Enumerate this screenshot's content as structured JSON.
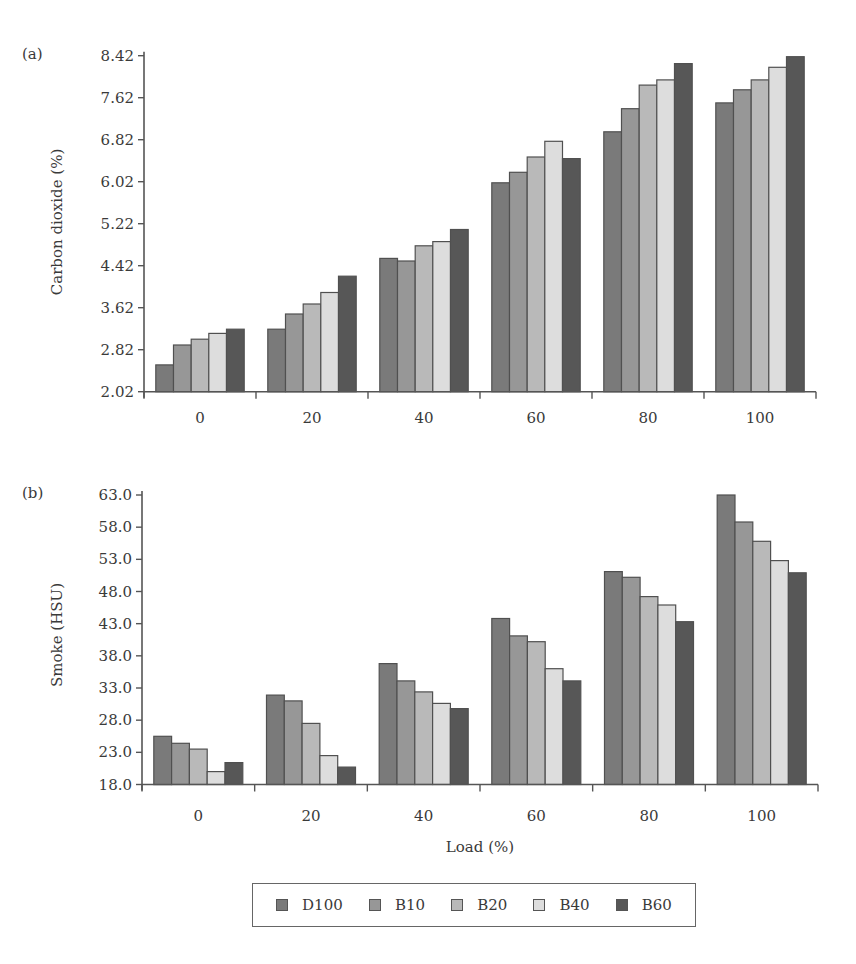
{
  "figure": {
    "legend": {
      "items": [
        {
          "label": "D100",
          "color": "#7a7a7a"
        },
        {
          "label": "B10",
          "color": "#979797"
        },
        {
          "label": "B20",
          "color": "#b9b9b9"
        },
        {
          "label": "B40",
          "color": "#dddddd"
        },
        {
          "label": "B60",
          "color": "#575757"
        }
      ]
    }
  },
  "chart_data": [
    {
      "type": "bar",
      "panel": "(a)",
      "title": "",
      "xlabel": "Load (%)",
      "ylabel": "Carbon dioxide (%)",
      "categories": [
        "0",
        "20",
        "40",
        "60",
        "80",
        "100"
      ],
      "yticks": [
        "2.02",
        "2.82",
        "3.62",
        "4.42",
        "5.22",
        "6.02",
        "6.82",
        "7.62",
        "8.42"
      ],
      "ylim": [
        2.02,
        8.42
      ],
      "grid": false,
      "legend_position": "bottom",
      "series": [
        {
          "name": "D100",
          "values": [
            2.53,
            3.21,
            4.56,
            6.0,
            6.97,
            7.52
          ]
        },
        {
          "name": "B10",
          "values": [
            2.91,
            3.5,
            4.51,
            6.2,
            7.41,
            7.77
          ]
        },
        {
          "name": "B20",
          "values": [
            3.02,
            3.69,
            4.8,
            6.49,
            7.86,
            7.96
          ]
        },
        {
          "name": "B40",
          "values": [
            3.13,
            3.91,
            4.88,
            6.79,
            7.96,
            8.2
          ]
        },
        {
          "name": "B60",
          "values": [
            3.21,
            4.22,
            5.11,
            6.46,
            8.27,
            8.4
          ]
        }
      ]
    },
    {
      "type": "bar",
      "panel": "(b)",
      "title": "",
      "xlabel": "Load (%)",
      "ylabel": "Smoke (HSU)",
      "categories": [
        "0",
        "20",
        "40",
        "60",
        "80",
        "100"
      ],
      "yticks": [
        "18.0",
        "23.0",
        "28.0",
        "33.0",
        "38.0",
        "43.0",
        "48.0",
        "53.0",
        "58.0",
        "63.0"
      ],
      "ylim": [
        18.0,
        63.0
      ],
      "grid": false,
      "legend_position": "bottom",
      "series": [
        {
          "name": "D100",
          "values": [
            25.5,
            31.9,
            36.8,
            43.8,
            51.1,
            63.0
          ]
        },
        {
          "name": "B10",
          "values": [
            24.4,
            31.0,
            34.1,
            41.1,
            50.2,
            58.8
          ]
        },
        {
          "name": "B20",
          "values": [
            23.5,
            27.5,
            32.4,
            40.2,
            47.2,
            55.8
          ]
        },
        {
          "name": "B40",
          "values": [
            20.0,
            22.5,
            30.6,
            36.0,
            45.9,
            52.8
          ]
        },
        {
          "name": "B60",
          "values": [
            21.4,
            20.7,
            29.8,
            34.1,
            43.3,
            50.9
          ]
        }
      ]
    }
  ]
}
